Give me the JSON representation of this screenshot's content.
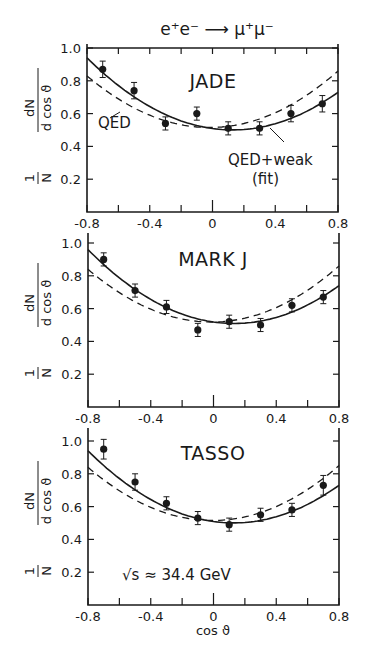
{
  "title": "e⁺e⁻ ⟶ μ⁺μ⁻",
  "ylabel_top": "dN",
  "ylabel_bottom": "N d cos ϑ",
  "ylabel_one": "1",
  "xlabel": "cos ϑ",
  "energy_annotation": "√s ≈ 34.4 GeV",
  "colors": {
    "ink": "#1a1a1a",
    "background": "#ffffff"
  },
  "chart_data": [
    {
      "type": "scatter",
      "title": "JADE",
      "xlabel": "cos ϑ",
      "ylabel": "1/N dN/d cos ϑ",
      "xlim": [
        -0.8,
        0.8
      ],
      "ylim": [
        0,
        1.0
      ],
      "xticks": [
        "-0.8",
        "-0.4",
        "0",
        "0.4",
        "0.8"
      ],
      "yticks": [
        "0.2",
        "0.4",
        "0.6",
        "0.8",
        "1.0"
      ],
      "grid": false,
      "x": [
        -0.7,
        -0.5,
        -0.3,
        -0.1,
        0.1,
        0.3,
        0.5,
        0.7
      ],
      "values": [
        0.87,
        0.74,
        0.54,
        0.6,
        0.51,
        0.51,
        0.6,
        0.66
      ],
      "errors": [
        0.05,
        0.05,
        0.04,
        0.04,
        0.04,
        0.04,
        0.05,
        0.05
      ],
      "series": [
        {
          "name": "QED+weak (fit)",
          "style": "solid",
          "endpoints": [
            0.94,
            0.73
          ]
        },
        {
          "name": "QED",
          "style": "dashed",
          "endpoints": [
            0.83,
            0.86
          ]
        }
      ],
      "annotations": [
        "QED",
        "QED+weak",
        "(fit)"
      ]
    },
    {
      "type": "scatter",
      "title": "MARK J",
      "xlabel": "cos ϑ",
      "ylabel": "1/N dN/d cos ϑ",
      "xlim": [
        -0.8,
        0.8
      ],
      "ylim": [
        0,
        1.0
      ],
      "xticks": [
        "-0.8",
        "-0.4",
        "0",
        "0.4",
        "0.8"
      ],
      "yticks": [
        "0.2",
        "0.4",
        "0.6",
        "0.8",
        "1.0"
      ],
      "grid": false,
      "x": [
        -0.7,
        -0.5,
        -0.3,
        -0.1,
        0.1,
        0.3,
        0.5,
        0.7
      ],
      "values": [
        0.9,
        0.71,
        0.61,
        0.47,
        0.52,
        0.5,
        0.62,
        0.67
      ],
      "errors": [
        0.04,
        0.04,
        0.04,
        0.04,
        0.04,
        0.04,
        0.04,
        0.04
      ],
      "series": [
        {
          "name": "QED+weak (fit)",
          "style": "solid",
          "endpoints": [
            0.96,
            0.74
          ]
        },
        {
          "name": "QED",
          "style": "dashed",
          "endpoints": [
            0.84,
            0.86
          ]
        }
      ]
    },
    {
      "type": "scatter",
      "title": "TASSO",
      "xlabel": "cos ϑ",
      "ylabel": "1/N dN/d cos ϑ",
      "xlim": [
        -0.8,
        0.8
      ],
      "ylim": [
        0,
        1.0
      ],
      "xticks": [
        "-0.8",
        "-0.4",
        "0",
        "0.4",
        "0.8"
      ],
      "yticks": [
        "0.2",
        "0.4",
        "0.6",
        "0.8",
        "1.0"
      ],
      "grid": false,
      "x": [
        -0.7,
        -0.5,
        -0.3,
        -0.1,
        0.1,
        0.3,
        0.5,
        0.7
      ],
      "values": [
        0.95,
        0.75,
        0.62,
        0.53,
        0.49,
        0.55,
        0.58,
        0.73
      ],
      "errors": [
        0.06,
        0.05,
        0.04,
        0.04,
        0.04,
        0.04,
        0.04,
        0.06
      ],
      "series": [
        {
          "name": "QED+weak (fit)",
          "style": "solid",
          "endpoints": [
            0.94,
            0.73
          ]
        },
        {
          "name": "QED",
          "style": "dashed",
          "endpoints": [
            0.84,
            0.85
          ]
        }
      ],
      "annotations": [
        "√s ≈ 34.4 GeV"
      ]
    }
  ]
}
